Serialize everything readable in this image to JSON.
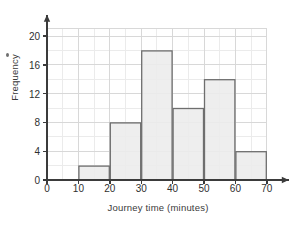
{
  "chart_data": {
    "type": "bar",
    "title": "",
    "subtitle": "",
    "xlabel": "Journey time (minutes)",
    "ylabel": "Frequency",
    "categories": [
      "10-20",
      "20-30",
      "30-40",
      "40-50",
      "50-60",
      "60-70"
    ],
    "bin_edges": [
      10,
      20,
      30,
      40,
      50,
      60,
      70
    ],
    "values": [
      2,
      8,
      18,
      10,
      14,
      4
    ],
    "xlim": [
      0,
      70
    ],
    "ylim": [
      0,
      21
    ],
    "x_ticks": [
      "0",
      "10",
      "20",
      "30",
      "40",
      "50",
      "60",
      "70"
    ],
    "x_tick_values": [
      0,
      10,
      20,
      30,
      40,
      50,
      60,
      70
    ],
    "y_ticks": [
      "0",
      "4",
      "8",
      "12",
      "16",
      "20"
    ],
    "y_tick_values": [
      0,
      4,
      8,
      12,
      16,
      20
    ],
    "grid": true,
    "grid_minor_x_step": 5,
    "grid_minor_y_step": 2,
    "legend": null,
    "legend_position": "none",
    "bar_fill_color": "#ececec",
    "bar_edge_color": "#6e6e6e",
    "axis_color": "#3b3b3b",
    "grid_color": "#d8d8d8",
    "grid_minor_color": "#ebebeb",
    "axis_arrows": true,
    "annotations": []
  },
  "figure": {
    "background_color": "#ffffff",
    "stray_mark_label": "stray-ink-dot"
  }
}
